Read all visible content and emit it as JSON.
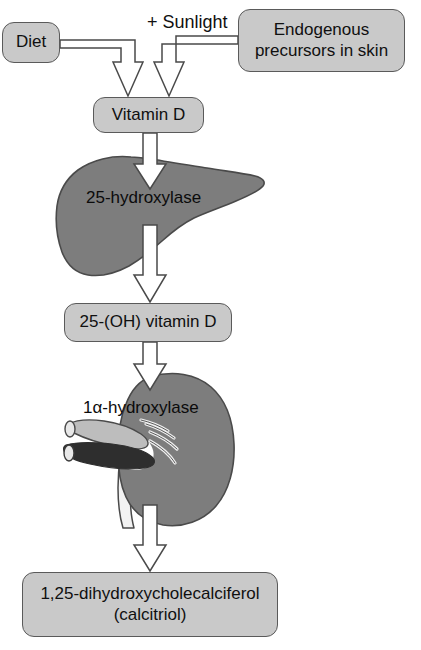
{
  "figure": {
    "type": "flow-diagram"
  },
  "nodes": {
    "diet": {
      "label": "Diet"
    },
    "endogenous": {
      "label": "Endogenous\nprecursors in skin"
    },
    "endogenous_line1": "Endogenous",
    "endogenous_line2": "precursors in skin",
    "vitamin_d": {
      "label": "Vitamin D"
    },
    "vitamin_d_25oh": {
      "label": "25-(OH) vitamin D"
    },
    "calcitriol_line1": "1,25-dihydroxycholecalciferol",
    "calcitriol_line2": "(calcitriol)"
  },
  "annotations": {
    "sunlight": "+ Sunlight"
  },
  "organs": {
    "liver": {
      "name": "liver",
      "enzyme_label": "25-hydroxylase"
    },
    "kidney": {
      "name": "kidney",
      "enzyme_label": "1α-hydroxylase"
    }
  },
  "colors": {
    "box_fill": "#c9c9c9",
    "box_stroke": "#5a5a5a",
    "organ_fill": "#7d7d7d",
    "organ_stroke": "#4a4a4a",
    "arrow_fill": "#ffffff",
    "arrow_stroke": "#4a4a4a",
    "vessel_light": "#bdbdbd",
    "vessel_dark": "#2e2e2e",
    "ureter": "#f2f2f2",
    "text": "#101010",
    "background": "#ffffff"
  },
  "flow": [
    {
      "from": "diet",
      "to": "vitamin_d",
      "arrow": "hollow"
    },
    {
      "from": "endogenous",
      "to": "vitamin_d",
      "arrow": "hollow",
      "note": "+ Sunlight"
    },
    {
      "from": "vitamin_d",
      "to": "liver",
      "arrow": "hollow"
    },
    {
      "from": "liver",
      "to": "vitamin_d_25oh",
      "arrow": "hollow"
    },
    {
      "from": "vitamin_d_25oh",
      "to": "kidney",
      "arrow": "hollow"
    },
    {
      "from": "kidney",
      "to": "calcitriol",
      "arrow": "hollow"
    }
  ]
}
